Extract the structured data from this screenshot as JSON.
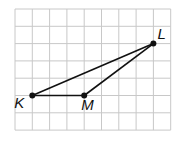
{
  "diagram": {
    "type": "triangle-on-grid",
    "grid": {
      "cols": 9,
      "rows": 7,
      "cell_px": 17.3,
      "origin": [
        15,
        9
      ],
      "line_color": "#c8c8c8"
    },
    "points": [
      {
        "id": "K",
        "label": "K",
        "grid": [
          1,
          5
        ]
      },
      {
        "id": "M",
        "label": "M",
        "grid": [
          4,
          5
        ]
      },
      {
        "id": "L",
        "label": "L",
        "grid": [
          8,
          2
        ]
      }
    ],
    "segments": [
      [
        "K",
        "M"
      ],
      [
        "M",
        "L"
      ],
      [
        "K",
        "L"
      ]
    ],
    "stroke_color": "#111111"
  }
}
